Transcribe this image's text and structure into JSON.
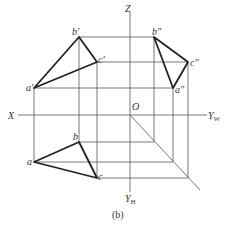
{
  "figure": {
    "caption": "(b)",
    "axes": {
      "x_label": "X",
      "z_label": "Z",
      "origin_label": "O",
      "yw_label": "Y",
      "yw_sub": "W",
      "yh_label": "Y",
      "yh_sub": "H"
    },
    "front_view": {
      "labels": [
        "a'",
        "b'",
        "c'"
      ]
    },
    "side_view": {
      "labels": [
        "a\"",
        "b\"",
        "c\""
      ]
    },
    "top_view": {
      "labels": [
        "a",
        "b",
        "c"
      ]
    }
  }
}
